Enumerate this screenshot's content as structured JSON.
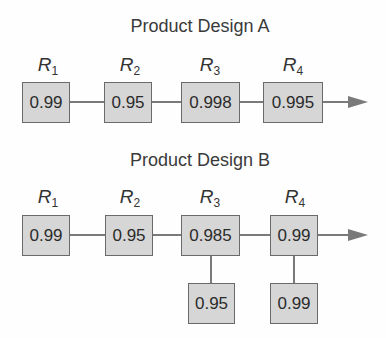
{
  "design_a": {
    "title": "Product Design A",
    "labels": [
      {
        "name": "R",
        "sub": "1"
      },
      {
        "name": "R",
        "sub": "2"
      },
      {
        "name": "R",
        "sub": "3"
      },
      {
        "name": "R",
        "sub": "4"
      }
    ],
    "components": [
      "0.99",
      "0.95",
      "0.998",
      "0.995"
    ]
  },
  "design_b": {
    "title": "Product Design B",
    "labels": [
      {
        "name": "R",
        "sub": "1"
      },
      {
        "name": "R",
        "sub": "2"
      },
      {
        "name": "R",
        "sub": "3"
      },
      {
        "name": "R",
        "sub": "4"
      }
    ],
    "components": [
      "0.99",
      "0.95",
      "0.985",
      "0.99"
    ],
    "backups": {
      "r3": "0.95",
      "r4": "0.99"
    }
  },
  "colors": {
    "box_fill": "#d6d6d6",
    "box_border": "#6a6a6a",
    "line": "#7a7a7a"
  }
}
